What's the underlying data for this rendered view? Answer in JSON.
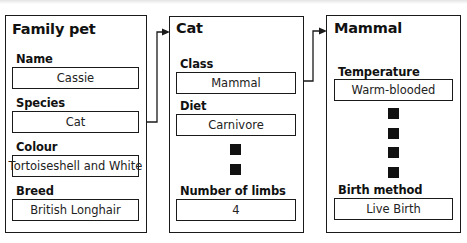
{
  "diagram": {
    "type": "object-inheritance",
    "cards": [
      {
        "title": "Family pet",
        "fields": [
          {
            "label": "Name",
            "value": "Cassie"
          },
          {
            "label": "Species",
            "value": "Cat"
          },
          {
            "label": "Colour",
            "value": "Tortoiseshell and White"
          },
          {
            "label": "Breed",
            "value": "British Longhair"
          }
        ]
      },
      {
        "title": "Cat",
        "fields": [
          {
            "label": "Class",
            "value": "Mammal"
          },
          {
            "label": "Diet",
            "value": "Carnivore"
          },
          {
            "label": "Number of limbs",
            "value": "4"
          }
        ],
        "ellipsis_markers": 2
      },
      {
        "title": "Mammal",
        "fields": [
          {
            "label": "Temperature",
            "value": "Warm-blooded"
          },
          {
            "label": "Birth method",
            "value": "Live Birth"
          }
        ],
        "ellipsis_markers": 4
      }
    ],
    "connections": [
      {
        "from": "Family pet.Species",
        "to": "Cat"
      },
      {
        "from": "Cat.Class",
        "to": "Mammal"
      }
    ]
  }
}
